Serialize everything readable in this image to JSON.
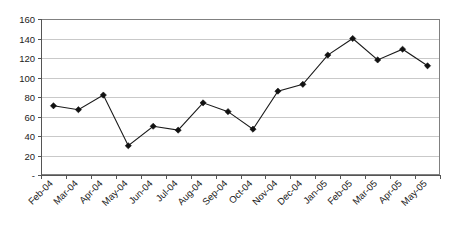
{
  "chart_data": {
    "type": "line",
    "title": "",
    "subtitle": "",
    "xlabel": "",
    "ylabel": "",
    "categories": [
      "Feb-04",
      "Mar-04",
      "Apr-04",
      "May-04",
      "Jun-04",
      "Jul-04",
      "Aug-04",
      "Sep-04",
      "Oct-04",
      "Nov-04",
      "Dec-04",
      "Jan-05",
      "Feb-05",
      "Mar-05",
      "Apr-05",
      "May-05"
    ],
    "values": [
      71,
      67,
      82,
      30,
      50,
      46,
      74,
      65,
      47,
      86,
      93,
      123,
      140,
      118,
      129,
      112
    ],
    "series": [
      {
        "name": "Series1",
        "values": [
          71,
          67,
          82,
          30,
          50,
          46,
          74,
          65,
          47,
          86,
          93,
          123,
          140,
          118,
          129,
          112
        ]
      }
    ],
    "ylim": [
      0,
      160
    ],
    "ytick_values": [
      0,
      20,
      40,
      60,
      80,
      100,
      120,
      140,
      160
    ],
    "ytick_labels": [
      "-",
      "20",
      "40",
      "60",
      "80",
      "100",
      "120",
      "140",
      "160"
    ],
    "grid": true,
    "grid_axis": "y",
    "legend": false,
    "legend_position": "none",
    "marker": "diamond",
    "marker_color": "#111111",
    "line_color": "#1a1a1a",
    "gridline_color": "#c9c9c9",
    "plot_background": "#ffffff",
    "xtick_label_rotation": -45,
    "annotations": []
  }
}
